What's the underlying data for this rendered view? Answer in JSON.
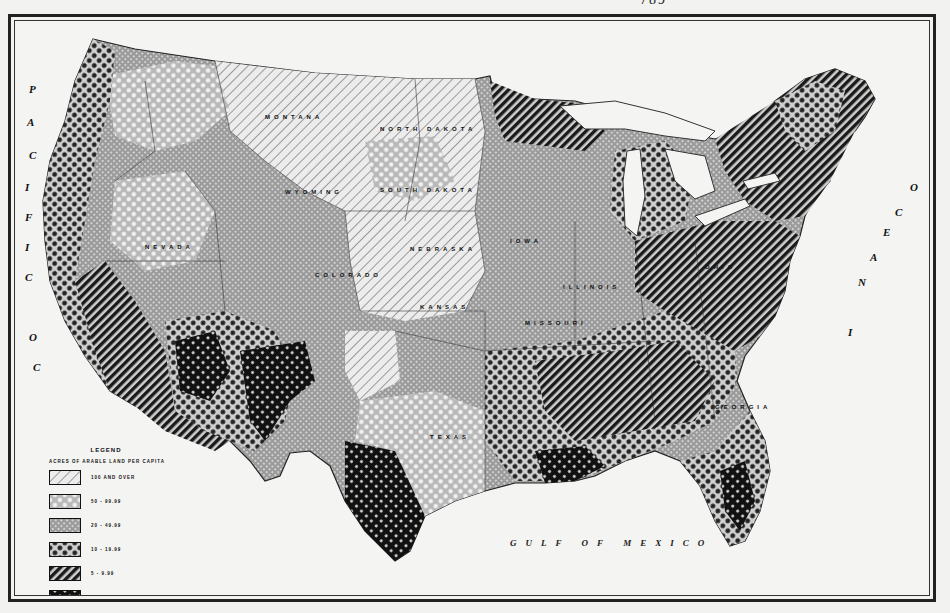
{
  "page": {
    "header_fragment": "789",
    "figure_type": "historical choropleth map of the United States"
  },
  "map": {
    "oceans": {
      "pacific": "PACIFIC OCEAN",
      "atlantic": "ATLANTIC OCEAN",
      "gulf": "GULF OF MEXICO"
    },
    "state_labels": [
      {
        "name": "NORTH DAKOTA",
        "x": 365,
        "y": 112
      },
      {
        "name": "SOUTH DAKOTA",
        "x": 365,
        "y": 173
      },
      {
        "name": "IOWA",
        "x": 495,
        "y": 224
      },
      {
        "name": "ILLINOIS",
        "x": 550,
        "y": 270
      },
      {
        "name": "MISSOURI",
        "x": 512,
        "y": 306
      },
      {
        "name": "KANSAS",
        "x": 405,
        "y": 290
      },
      {
        "name": "NEBRASKA",
        "x": 395,
        "y": 232
      },
      {
        "name": "MONTANA",
        "x": 250,
        "y": 100
      },
      {
        "name": "WYOMING",
        "x": 270,
        "y": 175
      },
      {
        "name": "COLORADO",
        "x": 300,
        "y": 258
      },
      {
        "name": "TEXAS",
        "x": 415,
        "y": 420
      },
      {
        "name": "NEVADA",
        "x": 130,
        "y": 230
      },
      {
        "name": "OHIO",
        "x": 690,
        "y": 250
      },
      {
        "name": "GEORGIA",
        "x": 700,
        "y": 390
      }
    ],
    "colors": {
      "paper": "#f4f4f2",
      "ink": "#111111",
      "light_gray": "#cfcfcf",
      "mid_gray": "#8e8e8e",
      "dark_gray": "#4a4a4a"
    }
  },
  "legend": {
    "title": "LEGEND",
    "subtitle": "ACRES OF ARABLE LAND PER CAPITA",
    "items": [
      {
        "label": "100 AND OVER",
        "pattern": "light-diagonal-hatch"
      },
      {
        "label": "50 - 99.99",
        "pattern": "open-dot-grid"
      },
      {
        "label": "20 - 49.99",
        "pattern": "fine-gray-grid"
      },
      {
        "label": "10 - 19.99",
        "pattern": "dark-dot-grid"
      },
      {
        "label": "5 - 9.99",
        "pattern": "heavy-diagonal-hatch"
      },
      {
        "label": "0 - 4.99",
        "pattern": "black-with-white-dots"
      }
    ]
  }
}
